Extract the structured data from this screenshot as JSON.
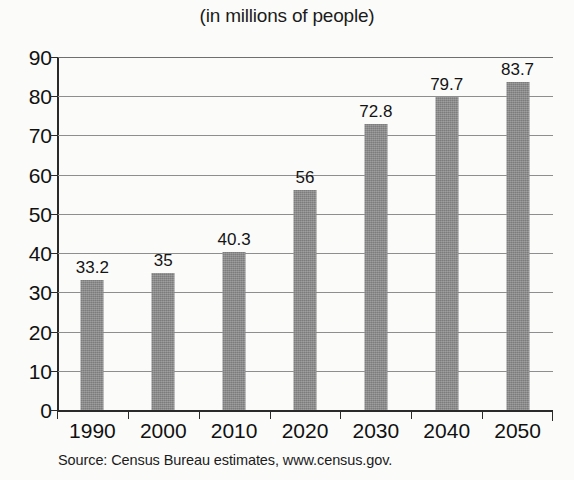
{
  "chart_data": {
    "type": "bar",
    "title": "(in millions of people)",
    "xlabel": "",
    "ylabel": "",
    "categories": [
      "1990",
      "2000",
      "2010",
      "2020",
      "2030",
      "2040",
      "2050"
    ],
    "values": [
      33.2,
      35,
      40.3,
      56,
      72.8,
      79.7,
      83.7
    ],
    "value_labels": [
      "33.2",
      "35",
      "40.3",
      "56",
      "72.8",
      "79.7",
      "83.7"
    ],
    "ylim": [
      0,
      90
    ],
    "ytick_labels": [
      "0",
      "10",
      "20",
      "30",
      "40",
      "50",
      "60",
      "70",
      "80",
      "90"
    ],
    "ytick_values": [
      0,
      10,
      20,
      30,
      40,
      50,
      60,
      70,
      80,
      90
    ],
    "grid": true,
    "grid_axis": "y",
    "legend": false,
    "bar_color": "#8b8b8b",
    "axis_color": "#2a2a2a",
    "gridline_color": "#8e8e8e",
    "source": "Source: Census Bureau estimates, www.census.gov."
  },
  "figure": {
    "title": "(in millions of people)",
    "source": "Source: Census Bureau estimates, www.census.gov."
  }
}
